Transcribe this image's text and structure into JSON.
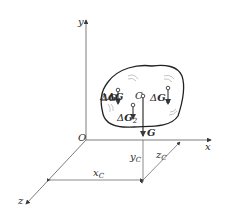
{
  "diagram": {
    "type": "center-of-gravity-3d",
    "axes": {
      "origin_label": "O",
      "x_label": "x",
      "y_label": "y",
      "z_label": "z"
    },
    "body": {
      "centroid_label": "C",
      "resultant_label": "G",
      "elements": [
        {
          "label": "ΔG",
          "sub": "1"
        },
        {
          "label": "ΔG",
          "sub": "2"
        },
        {
          "label": "ΔG",
          "sub": "n"
        }
      ]
    },
    "dimensions": {
      "xc": {
        "label": "x",
        "sub": "C"
      },
      "yc": {
        "label": "y",
        "sub": "C"
      },
      "zc": {
        "label": "z",
        "sub": "C"
      }
    },
    "colors": {
      "line": "#3a3a3a",
      "background": "#ffffff"
    }
  }
}
